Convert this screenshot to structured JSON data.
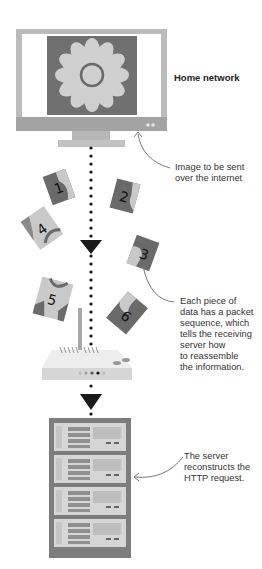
{
  "diagram": {
    "labels": {
      "home_network": "Home network",
      "image_sent": [
        "Image to be sent",
        "over the internet"
      ],
      "packet_sequence": [
        "Each piece of",
        "data has a packet",
        "sequence, which",
        "tells the receiving",
        "server how",
        "to reassemble",
        "the information."
      ],
      "server_reconstructs": [
        "The server",
        "reconstructs the",
        "HTTP request."
      ]
    },
    "nodes": [
      {
        "id": "monitor",
        "type": "computer-monitor",
        "content": "flower image"
      },
      {
        "id": "router",
        "type": "wireless-router"
      },
      {
        "id": "server",
        "type": "server-rack",
        "units": 4
      }
    ],
    "packets": [
      "1",
      "2",
      "3",
      "4",
      "5",
      "6"
    ],
    "colors": {
      "monitor_bezel": "#b9b9b9",
      "monitor_bottom": "#9e9e9e",
      "image_bg": "#6e6e6e",
      "flower": "#cfcfcf",
      "packet_dark": "#6a6a6a",
      "packet_light": "#cccccc",
      "arrow": "#1a1a1a",
      "rack": "#7c7c7c",
      "rack_unit": "#d4d4d4"
    }
  }
}
